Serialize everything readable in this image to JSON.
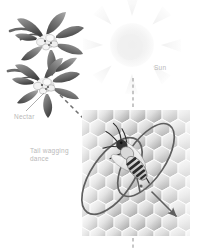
{
  "figure": {
    "background": "#ffffff",
    "width": 199,
    "height": 249
  },
  "labels": {
    "sun": "Sun",
    "nectar": "Nectar",
    "dance_line1": "Tail wagging",
    "dance_line2": "dance"
  },
  "colors": {
    "label_text": "#b9b9b9",
    "dashed_line": "#9a9a9a",
    "dance_path": "#6b6b6b",
    "comb_light": "#f2f2f2",
    "comb_mid": "#cfcfcf",
    "comb_dark": "#9e9e9e",
    "sun_fill": "#f4f4f4",
    "flower_dark": "#4a4a4a",
    "bee_dark": "#2b2b2b"
  },
  "elements": {
    "sun": {
      "name": "sun",
      "cx": 132,
      "cy": 45,
      "r": 22,
      "rays": 8
    },
    "vertical_dashed_line": {
      "x": 133,
      "y_top": 78,
      "y_bottom": 248
    },
    "diagonal_dashed_line": {
      "x1": 62,
      "y1": 97,
      "x2": 106,
      "y2": 141
    },
    "honeycomb_panel": {
      "x": 82,
      "y": 110,
      "width": 108,
      "height": 126
    },
    "bee": {
      "cx": 124,
      "cy": 157,
      "angle_deg": 35
    },
    "dance_path": {
      "type": "figure-eight",
      "loops": 2,
      "arrow": true
    },
    "flowers": [
      {
        "name": "flower-upper",
        "cx": 48,
        "cy": 40
      },
      {
        "name": "flower-lower",
        "cx": 44,
        "cy": 83
      }
    ]
  }
}
